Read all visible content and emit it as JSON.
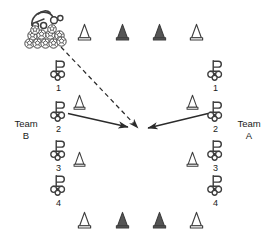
{
  "diagram": {
    "background_color": "#ffffff",
    "stroke_color": "#3a3a3a",
    "cone_fill_dark": "#555555",
    "cone_fill_light": "#ffffff",
    "width": 273,
    "height": 246,
    "labels": {
      "team_b_line1": "Team",
      "team_b_line2": "B",
      "team_a_line1": "Team",
      "team_a_line2": "A"
    },
    "ball_supply": {
      "name": "ball-pile",
      "coach_icon": "coach-figure-icon",
      "ball_icon": "soccer-ball-icon",
      "ball_count": 11
    },
    "cones_top": [
      {
        "id": "cone-top-1",
        "x": 84,
        "y": 30,
        "fill": "light"
      },
      {
        "id": "cone-top-2",
        "x": 122,
        "y": 30,
        "fill": "dark"
      },
      {
        "id": "cone-top-3",
        "x": 159,
        "y": 30,
        "fill": "dark"
      },
      {
        "id": "cone-top-4",
        "x": 196,
        "y": 30,
        "fill": "light"
      }
    ],
    "cones_bottom": [
      {
        "id": "cone-bottom-1",
        "x": 84,
        "y": 218,
        "fill": "light"
      },
      {
        "id": "cone-bottom-2",
        "x": 122,
        "y": 218,
        "fill": "dark"
      },
      {
        "id": "cone-bottom-3",
        "x": 159,
        "y": 218,
        "fill": "dark"
      },
      {
        "id": "cone-bottom-4",
        "x": 196,
        "y": 218,
        "fill": "light"
      }
    ],
    "cones_inner": [
      {
        "id": "cone-inner-left-upper",
        "x": 79,
        "y": 101,
        "fill": "light"
      },
      {
        "id": "cone-inner-left-lower",
        "x": 79,
        "y": 158,
        "fill": "light"
      },
      {
        "id": "cone-inner-right-upper",
        "x": 192,
        "y": 101,
        "fill": "light"
      },
      {
        "id": "cone-inner-right-lower",
        "x": 192,
        "y": 158,
        "fill": "light"
      }
    ],
    "players_team_b": [
      {
        "id": "player-b-1",
        "number": "1",
        "x": 58,
        "y": 68
      },
      {
        "id": "player-b-2",
        "number": "2",
        "x": 58,
        "y": 111
      },
      {
        "id": "player-b-3",
        "number": "3",
        "x": 58,
        "y": 150
      },
      {
        "id": "player-b-4",
        "number": "4",
        "x": 58,
        "y": 185
      }
    ],
    "players_team_a": [
      {
        "id": "player-a-1",
        "number": "1",
        "x": 215,
        "y": 68
      },
      {
        "id": "player-a-2",
        "number": "2",
        "x": 215,
        "y": 111
      },
      {
        "id": "player-a-3",
        "number": "3",
        "x": 215,
        "y": 150
      },
      {
        "id": "player-a-4",
        "number": "4",
        "x": 215,
        "y": 185
      }
    ],
    "arrows": [
      {
        "id": "arrow-ball-pass",
        "style": "dashed",
        "from_x": 61,
        "from_y": 47,
        "to_x": 138,
        "to_y": 128
      },
      {
        "id": "arrow-team-b-run",
        "style": "solid",
        "from_x": 68,
        "from_y": 114,
        "to_x": 128,
        "to_y": 127
      },
      {
        "id": "arrow-team-a-run",
        "style": "solid",
        "from_x": 208,
        "from_y": 114,
        "to_x": 148,
        "to_y": 128
      }
    ]
  }
}
